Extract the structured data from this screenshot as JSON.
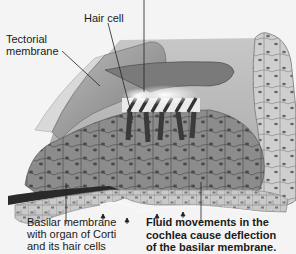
{
  "figure": {
    "type": "anatomical-illustration",
    "style": "grayscale"
  },
  "labels": {
    "hair_cell": "Hair cell",
    "tectorial_membrane": "Tectorial\nmembrane",
    "basilar_membrane": "Basilar membrane\nwith organ of Corti\nand its hair cells",
    "fluid_caption": "Fluid movements in the\ncochlea cause deflection\nof the basilar membrane."
  },
  "colors": {
    "background": "#f4f4f4",
    "tissue_dark": "#6e6e6e",
    "tissue_mid": "#9a9a9a",
    "tissue_light": "#c4c4c4",
    "membrane_light": "#dadada",
    "text": "#1a1a1a"
  }
}
